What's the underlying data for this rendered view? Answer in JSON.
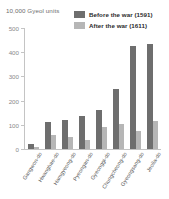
{
  "chart_data": {
    "type": "bar",
    "title": "",
    "ylabel": "10,000 Gyeol units",
    "xlabel": "",
    "ylim": [
      0,
      500
    ],
    "yticks": [
      0,
      100,
      200,
      300,
      400,
      500
    ],
    "grid": false,
    "legend_position": "top-right",
    "categories": [
      "Gangwon-do",
      "Hwanghae-do",
      "Hamgyeong-do",
      "Pyeongan-do",
      "Gyeonggi-do",
      "Chungcheong-do",
      "Gyeongsang-do",
      "Jeolla-do"
    ],
    "series": [
      {
        "name": "Before the war (1591)",
        "color": "#6e6e6e",
        "values": [
          20,
          110,
          120,
          135,
          160,
          250,
          425,
          435
        ]
      },
      {
        "name": "After the war (1611)",
        "color": "#b6b6b6",
        "values": [
          8,
          58,
          48,
          38,
          90,
          102,
          75,
          115
        ]
      }
    ]
  },
  "axis": {
    "y_title": "10,000 Gyeol units",
    "y_tick_labels": [
      "500",
      "400",
      "300",
      "200",
      "100",
      "0"
    ]
  },
  "legend": {
    "items": [
      {
        "label": "Before the war (1591)",
        "color": "#6e6e6e"
      },
      {
        "label": "After the war (1611)",
        "color": "#b6b6b6"
      }
    ]
  }
}
